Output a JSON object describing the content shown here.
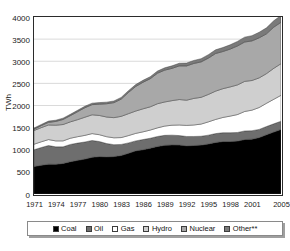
{
  "chart_data": {
    "type": "area",
    "stacked": true,
    "title": "",
    "xlabel": "",
    "ylabel": "TWh",
    "ylim": [
      0,
      4000
    ],
    "ytick_step": 500,
    "yticks": [
      4000,
      3500,
      3000,
      2500,
      2000,
      1500,
      1000,
      500,
      0
    ],
    "ytick_labels": [
      "4000",
      "3500",
      "3000",
      "2500",
      "2000",
      "1500",
      "1000",
      "500",
      "0"
    ],
    "xlim": [
      1971,
      2005
    ],
    "xticks": [
      1971,
      1974,
      1977,
      1980,
      1983,
      1986,
      1989,
      1992,
      1995,
      1998,
      2001,
      2005
    ],
    "xtick_labels": [
      "1971",
      "1974",
      "1977",
      "1980",
      "1983",
      "1986",
      "1989",
      "1992",
      "1995",
      "1998",
      "2001",
      "2005"
    ],
    "grid": "horizontal",
    "legend_position": "bottom",
    "x": [
      1971,
      1972,
      1973,
      1974,
      1975,
      1976,
      1977,
      1978,
      1979,
      1980,
      1981,
      1982,
      1983,
      1984,
      1985,
      1986,
      1987,
      1988,
      1989,
      1990,
      1991,
      1992,
      1993,
      1994,
      1995,
      1996,
      1997,
      1998,
      1999,
      2000,
      2001,
      2002,
      2003,
      2004,
      2005
    ],
    "series": [
      {
        "name": "Coal",
        "color": "#000000",
        "values": [
          620,
          650,
          675,
          670,
          690,
          730,
          760,
          790,
          830,
          845,
          840,
          845,
          870,
          920,
          975,
          1000,
          1035,
          1075,
          1100,
          1110,
          1105,
          1090,
          1095,
          1105,
          1130,
          1165,
          1185,
          1185,
          1195,
          1230,
          1240,
          1275,
          1340,
          1400,
          1460
        ]
      },
      {
        "name": "Oil",
        "color": "#6e6e6e",
        "values": [
          380,
          400,
          420,
          395,
          375,
          390,
          390,
          385,
          380,
          340,
          300,
          270,
          250,
          235,
          225,
          230,
          225,
          225,
          225,
          220,
          215,
          210,
          205,
          200,
          200,
          200,
          200,
          200,
          195,
          195,
          190,
          185,
          185,
          185,
          185
        ]
      },
      {
        "name": "Gas",
        "color": "#ffffff",
        "values": [
          125,
          130,
          135,
          135,
          135,
          140,
          145,
          150,
          155,
          155,
          155,
          155,
          155,
          165,
          170,
          175,
          185,
          195,
          210,
          225,
          240,
          250,
          260,
          275,
          300,
          320,
          345,
          375,
          405,
          440,
          465,
          495,
          525,
          555,
          585
        ]
      },
      {
        "name": "Hydro",
        "color": "#cfcfcf",
        "values": [
          310,
          320,
          330,
          355,
          370,
          370,
          385,
          410,
          425,
          435,
          445,
          455,
          480,
          495,
          505,
          520,
          525,
          545,
          545,
          555,
          575,
          570,
          600,
          605,
          620,
          640,
          650,
          660,
          670,
          680,
          670,
          670,
          670,
          700,
          715
        ]
      },
      {
        "name": "Nuclear",
        "color": "#a8a8a8",
        "values": [
          30,
          45,
          60,
          85,
          115,
          140,
          180,
          215,
          230,
          255,
          300,
          340,
          390,
          480,
          555,
          600,
          635,
          690,
          720,
          730,
          760,
          775,
          790,
          800,
          820,
          850,
          840,
          855,
          880,
          890,
          895,
          905,
          900,
          930,
          935
        ]
      },
      {
        "name": "Other**",
        "color": "#7a7a7a",
        "values": [
          25,
          26,
          27,
          28,
          29,
          30,
          31,
          32,
          33,
          35,
          36,
          37,
          38,
          40,
          42,
          44,
          46,
          48,
          52,
          56,
          60,
          64,
          68,
          73,
          78,
          84,
          90,
          96,
          103,
          110,
          118,
          126,
          135,
          145,
          155
        ]
      }
    ]
  },
  "legend": {
    "items": [
      {
        "label": "Coal"
      },
      {
        "label": "Oil"
      },
      {
        "label": "Gas"
      },
      {
        "label": "Hydro"
      },
      {
        "label": "Nuclear"
      },
      {
        "label": "Other**"
      }
    ]
  }
}
